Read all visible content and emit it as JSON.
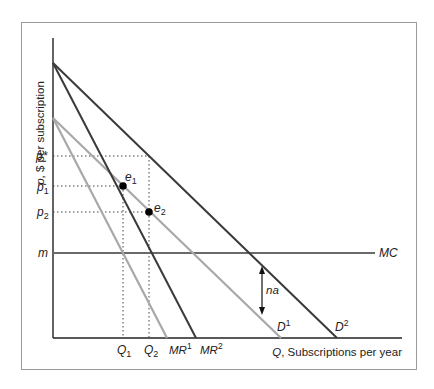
{
  "diagram": {
    "y_axis_label": "p, $ per subscription",
    "x_axis_label": "Q, Subscriptions per year",
    "y_ticks": [
      {
        "label": "p*",
        "y": 156
      },
      {
        "label": "p1",
        "y": 186
      },
      {
        "label": "p2",
        "y": 212
      },
      {
        "label": "m",
        "y": 253
      }
    ],
    "x_ticks": [
      {
        "label": "Q1",
        "x": 123
      },
      {
        "label": "Q2",
        "x": 149
      }
    ],
    "curves": [
      {
        "name": "D1",
        "color": "#a8a8a8",
        "from": [
          53,
          118
        ],
        "to": [
          281,
          338
        ]
      },
      {
        "name": "D2",
        "color": "#3a3a3a",
        "from": [
          53,
          63
        ],
        "to": [
          337,
          338
        ]
      },
      {
        "name": "MR1",
        "color": "#a8a8a8",
        "from": [
          53,
          118
        ],
        "to": [
          167,
          338
        ]
      },
      {
        "name": "MR2",
        "color": "#3a3a3a",
        "from": [
          53,
          63
        ],
        "to": [
          196,
          338
        ]
      },
      {
        "name": "MC",
        "color": "#6a6a6a",
        "from": [
          53,
          253
        ],
        "to": [
          375,
          253
        ]
      }
    ],
    "points": [
      {
        "name": "e1",
        "x": 123,
        "y": 186
      },
      {
        "name": "e2",
        "x": 149,
        "y": 212
      }
    ],
    "annotation": {
      "label": "na",
      "x": 262,
      "y_top": 268,
      "y_bottom": 313
    },
    "labels": {
      "p_star": "p*",
      "p1_base": "p",
      "p1_sub": "1",
      "p2_base": "p",
      "p2_sub": "2",
      "m": "m",
      "q1_base": "Q",
      "q1_sub": "1",
      "q2_base": "Q",
      "q2_sub": "2",
      "mr1_base": "MR",
      "mr1_sup": "1",
      "mr2_base": "MR",
      "mr2_sup": "2",
      "d1_base": "D",
      "d1_sup": "1",
      "d2_base": "D",
      "d2_sup": "2",
      "mc": "MC",
      "e1_base": "e",
      "e1_sub": "1",
      "e2_base": "e",
      "e2_sub": "2",
      "na": "na",
      "x_axis_var": "Q",
      "x_axis_rest": ", Subscriptions per year",
      "y_axis_var": "p",
      "y_axis_rest": ", $ per subscription"
    },
    "colors": {
      "dark_line": "#3a3a3a",
      "light_line": "#a8a8a8",
      "mc_line": "#6a6a6a",
      "axis": "#222222",
      "frame": "#9a9a9a"
    }
  }
}
